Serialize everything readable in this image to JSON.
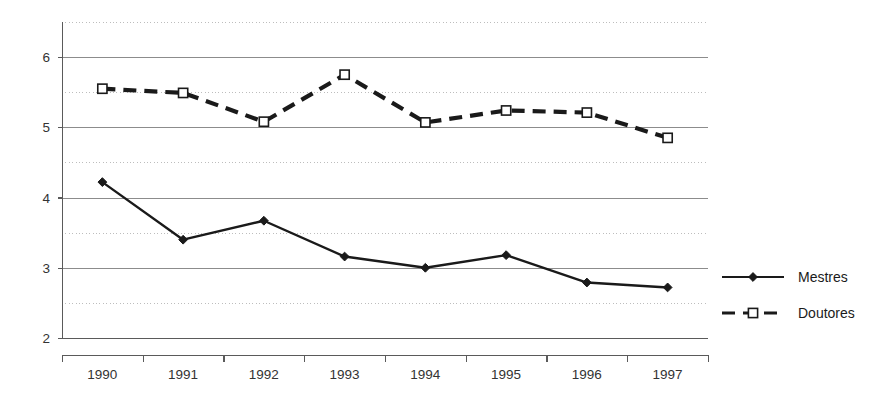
{
  "chart_data": {
    "type": "line",
    "title": "",
    "subtitle": "",
    "xlabel": "",
    "ylabel": "",
    "categories": [
      "1990",
      "1991",
      "1992",
      "1993",
      "1994",
      "1995",
      "1996",
      "1997"
    ],
    "series": [
      {
        "name": "Mestres",
        "marker": "filled-diamond",
        "linestyle": "solid",
        "color": "#1a1a1a",
        "values": [
          4.22,
          3.4,
          3.67,
          3.16,
          3.0,
          3.18,
          2.79,
          2.72
        ]
      },
      {
        "name": "Doutores",
        "marker": "open-square",
        "linestyle": "dashed",
        "color": "#1a1a1a",
        "values": [
          5.55,
          5.49,
          5.08,
          5.75,
          5.07,
          5.24,
          5.21,
          4.85
        ]
      }
    ],
    "ylim": [
      2,
      6.5
    ],
    "yticks": [
      2,
      3,
      4,
      5,
      6
    ],
    "ytick_labels": [
      "2",
      "3",
      "4",
      "5",
      "6"
    ],
    "minor_yticks": [
      2.5,
      3.5,
      4.5,
      5.5,
      6.5
    ],
    "grid": {
      "major_horizontal": true,
      "minor_horizontal_dotted": true,
      "vertical": false
    },
    "legend": {
      "position": "right",
      "entries": [
        "Mestres",
        "Doutores"
      ]
    },
    "colors": {
      "line": "#1a1a1a",
      "major_gridline": "#8c8c8c",
      "minor_gridline": "#bdbdbd",
      "axis": "#5a5a5a",
      "background": "#ffffff",
      "text": "#333333"
    }
  }
}
